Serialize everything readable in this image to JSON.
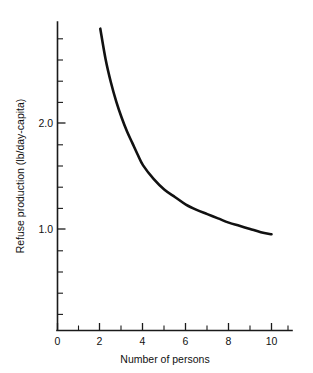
{
  "chart_data": {
    "type": "line",
    "title": "",
    "subtitle": "",
    "xlabel": "Number of persons",
    "ylabel": "Refuse production (lb/day-capita)",
    "xlim": [
      0,
      11.2
    ],
    "ylim": [
      0,
      3.1
    ],
    "grid": false,
    "legend": null,
    "legend_position": "none",
    "line_color": "#111111",
    "background_color": "#ffffff",
    "axis_color": "#1a1a1a",
    "x_ticks_major": [
      0,
      2,
      4,
      6,
      8,
      10
    ],
    "x_tick_labels": [
      "0",
      "2",
      "4",
      "6",
      "8",
      "10"
    ],
    "x_ticks_minor": [
      1,
      3,
      5,
      7,
      9,
      11
    ],
    "y_ticks_major": [
      1.0,
      2.0
    ],
    "y_tick_labels": [
      "1.0",
      "2.0"
    ],
    "y_ticks_minor": [
      0.2,
      0.4,
      0.6,
      0.8,
      1.2,
      1.4,
      1.6,
      1.8,
      2.2,
      2.4,
      2.6,
      2.8
    ],
    "series": [
      {
        "name": "Refuse production per capita",
        "x": [
          2.0,
          2.25,
          2.5,
          2.75,
          3.0,
          3.25,
          3.5,
          3.75,
          4.0,
          4.5,
          5.0,
          5.5,
          6.0,
          6.5,
          7.0,
          7.5,
          8.0,
          8.5,
          9.0,
          9.5,
          10.0
        ],
        "values": [
          2.89,
          2.6,
          2.38,
          2.2,
          2.05,
          1.92,
          1.81,
          1.7,
          1.6,
          1.47,
          1.37,
          1.3,
          1.23,
          1.18,
          1.14,
          1.1,
          1.06,
          1.03,
          1.0,
          0.97,
          0.95
        ]
      }
    ],
    "annotations": []
  },
  "axes": {
    "x_title": "Number of persons",
    "y_title": "Refuse production (lb/day-capita)",
    "x_labels": [
      "0",
      "2",
      "4",
      "6",
      "8",
      "10"
    ],
    "y_labels": [
      "2.0",
      "1.0"
    ]
  }
}
